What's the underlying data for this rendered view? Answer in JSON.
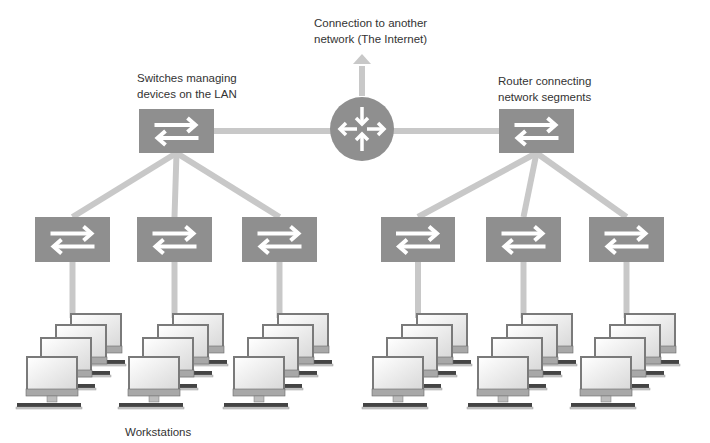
{
  "labels": {
    "internet": [
      "Connection to another",
      "network (The Internet)"
    ],
    "switches": [
      "Switches managing",
      "devices on the LAN"
    ],
    "router": [
      "Router connecting",
      "network segments"
    ],
    "workstations": "Workstations"
  },
  "colors": {
    "device": "#8f8f8f",
    "link": "#c8c8c8",
    "arrow": "#ffffff",
    "text": "#333333"
  },
  "nodes": {
    "router": {
      "name": "router",
      "icon": "router-icon",
      "cx": 362,
      "cy": 129,
      "r": 32
    },
    "top_switches": [
      {
        "name": "top-switch-left",
        "x": 139,
        "y": 109,
        "w": 75,
        "h": 44
      },
      {
        "name": "top-switch-right",
        "x": 499,
        "y": 109,
        "w": 75,
        "h": 44
      }
    ],
    "lower_switches": [
      {
        "name": "lower-switch-1",
        "x": 35,
        "y": 217,
        "w": 75,
        "h": 45,
        "parent": 0
      },
      {
        "name": "lower-switch-2",
        "x": 137,
        "y": 217,
        "w": 75,
        "h": 45,
        "parent": 0
      },
      {
        "name": "lower-switch-3",
        "x": 242,
        "y": 217,
        "w": 75,
        "h": 45,
        "parent": 0
      },
      {
        "name": "lower-switch-4",
        "x": 381,
        "y": 217,
        "w": 74,
        "h": 45,
        "parent": 1
      },
      {
        "name": "lower-switch-5",
        "x": 486,
        "y": 217,
        "w": 75,
        "h": 45,
        "parent": 1
      },
      {
        "name": "lower-switch-6",
        "x": 589,
        "y": 217,
        "w": 75,
        "h": 45,
        "parent": 1
      }
    ],
    "workstation_clusters": [
      {
        "x": 72,
        "count": 4
      },
      {
        "x": 174,
        "count": 4
      },
      {
        "x": 279,
        "count": 4
      },
      {
        "x": 418,
        "count": 4
      },
      {
        "x": 523,
        "count": 4
      },
      {
        "x": 626,
        "count": 4
      }
    ]
  }
}
